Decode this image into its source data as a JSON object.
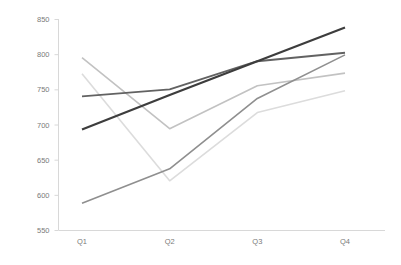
{
  "chart_data": {
    "type": "line",
    "title": "",
    "subtitle": "",
    "xlabel": "",
    "ylabel": "",
    "categories": [
      "Q1",
      "Q2",
      "Q3",
      "Q4"
    ],
    "ylim": [
      550,
      850
    ],
    "y_ticks": [
      550,
      600,
      650,
      700,
      750,
      800,
      850
    ],
    "y_tick_labels": [
      "550",
      "600",
      "650",
      "700",
      "750",
      "800",
      "850"
    ],
    "x_tick_labels": [
      "Q1",
      "Q2",
      "Q3",
      "Q4"
    ],
    "grid": false,
    "legend": false,
    "legend_position": "none",
    "series": [
      {
        "name": "Series 1",
        "color": "#3d3d3d",
        "width": 2.2,
        "values": [
          693,
          742,
          790,
          838
        ]
      },
      {
        "name": "Series 2",
        "color": "#626262",
        "width": 1.9,
        "values": [
          740,
          750,
          790,
          802
        ]
      },
      {
        "name": "Series 3",
        "color": "#8f8f8f",
        "width": 1.6,
        "values": [
          588,
          637,
          737,
          799
        ]
      },
      {
        "name": "Series 4",
        "color": "#c2c2c2",
        "width": 1.6,
        "values": [
          795,
          694,
          755,
          773
        ]
      },
      {
        "name": "Series 5",
        "color": "#dcdcdc",
        "width": 1.6,
        "values": [
          772,
          620,
          717,
          748
        ]
      }
    ]
  },
  "axes": {
    "axis_color": "#d8d8d8",
    "tick_text_color": "#7a7a7a"
  }
}
